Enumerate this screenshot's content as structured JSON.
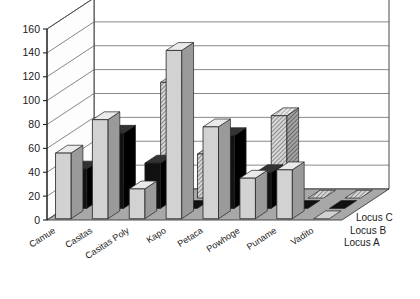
{
  "chart_data": {
    "type": "bar",
    "title": "",
    "subtitle": "",
    "xlabel": "",
    "ylabel": "",
    "ylim": [
      0,
      160
    ],
    "yticks": [
      0,
      20,
      40,
      60,
      80,
      100,
      120,
      140,
      160
    ],
    "grid": true,
    "legend_position": "right",
    "projection": "3d",
    "categories": [
      "Camue",
      "Casitas",
      "Casitas Poly",
      "Kapo",
      "Petaca",
      "Powhoge",
      "Puname",
      "Vadito"
    ],
    "series": [
      {
        "name": "Locus A",
        "color": "#cccccc",
        "fill": "solid-light-gray",
        "values": [
          55,
          83,
          25,
          141,
          77,
          34,
          41,
          0
        ]
      },
      {
        "name": "Locus B",
        "color": "#111111",
        "fill": "solid-black",
        "values": [
          33,
          63,
          38,
          0,
          61,
          30,
          0,
          0
        ]
      },
      {
        "name": "Locus C",
        "color": "#bdbdbd",
        "fill": "hatched",
        "values": [
          0,
          0,
          97,
          37,
          0,
          69,
          0,
          0
        ]
      }
    ]
  },
  "axis": {
    "tick_labels": [
      "160",
      "140",
      "120",
      "100",
      "80",
      "60",
      "40",
      "20",
      "0"
    ]
  },
  "legend": {
    "entries": [
      {
        "label": "Locus C",
        "fill": "hatched"
      },
      {
        "label": "Locus B",
        "fill": "solid-black"
      },
      {
        "label": "Locus A",
        "fill": "solid-light-gray"
      }
    ]
  },
  "colors": {
    "floor": "#a8a8a8",
    "wall": "#ffffff",
    "gridline": "#555555",
    "axis": "#222222",
    "bar_light_front": "#d2d2d2",
    "bar_light_top": "#eaeaea",
    "bar_light_side": "#9a9a9a",
    "bar_black_front": "#111111",
    "bar_black_top": "#333333",
    "bar_black_side": "#000000",
    "bar_hatch_front": "#c9c9c9",
    "bar_hatch_top": "#e2e2e2",
    "bar_hatch_side": "#8e8e8e"
  }
}
